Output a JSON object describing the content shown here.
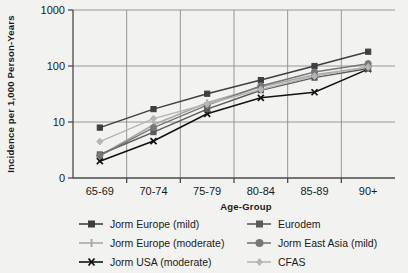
{
  "chart_data": {
    "type": "line",
    "title": "",
    "xlabel": "Age-Group",
    "ylabel": "Incidence per 1,000 Person-Years",
    "categories": [
      "65-69",
      "70-74",
      "75-79",
      "80-84",
      "85-89",
      "90+"
    ],
    "yticks": [
      0,
      10,
      100,
      1000
    ],
    "ytick_labels": [
      "0",
      "10",
      "100",
      "1000"
    ],
    "yscale": "log-like (0,10,100,1000 evenly spaced)",
    "ylim": [
      0,
      1000
    ],
    "grid": "vertical gridlines at category boundaries, horizontal gridlines at 10 / 100 / 1000",
    "legend_position": "below-plot, two columns",
    "series": [
      {
        "name": "Jorm Europe (mild)",
        "color": "#3f3f3f",
        "marker": "square",
        "values": [
          9.0,
          17.0,
          32.0,
          56.0,
          100.0,
          180.0
        ]
      },
      {
        "name": "Jorm Europe (moderate)",
        "color": "#a8a8a8",
        "marker": "plus",
        "values": [
          4.0,
          9.5,
          22.0,
          42.0,
          70.0,
          95.0
        ]
      },
      {
        "name": "Jorm USA (moderate)",
        "color": "#111111",
        "marker": "x",
        "values": [
          3.0,
          6.6,
          14.0,
          27.0,
          34.0,
          88.0
        ]
      },
      {
        "name": "Eurodem",
        "color": "#5a5a5a",
        "marker": "square",
        "values": [
          4.2,
          8.2,
          17.0,
          37.0,
          62.0,
          90.0
        ]
      },
      {
        "name": "Jorm East Asia (mild)",
        "color": "#777777",
        "marker": "circle",
        "values": [
          4.0,
          9.0,
          20.0,
          44.0,
          78.0,
          110.0
        ]
      },
      {
        "name": "CFAS",
        "color": "#b5b5b5",
        "marker": "diamond",
        "values": [
          6.5,
          11.5,
          21.0,
          38.0,
          66.0,
          96.0
        ]
      }
    ]
  },
  "axes": {
    "y_title": "Incidence per 1,000 Person-Years",
    "x_title": "Age-Group"
  },
  "legend": {
    "entries": [
      {
        "label": "Jorm Europe (mild)",
        "color": "#3f3f3f",
        "marker": "square"
      },
      {
        "label": "Jorm Europe (moderate)",
        "color": "#a8a8a8",
        "marker": "plus"
      },
      {
        "label": "Jorm USA (moderate)",
        "color": "#111111",
        "marker": "x"
      },
      {
        "label": "Eurodem",
        "color": "#5a5a5a",
        "marker": "square"
      },
      {
        "label": "Jorm East Asia (mild)",
        "color": "#777777",
        "marker": "circle"
      },
      {
        "label": "CFAS",
        "color": "#b5b5b5",
        "marker": "diamond"
      }
    ]
  },
  "colors": {
    "background": "#f2f2f0",
    "axis": "#4a4a4a",
    "grid": "#8c8c8c",
    "text": "#1a1a1a"
  }
}
